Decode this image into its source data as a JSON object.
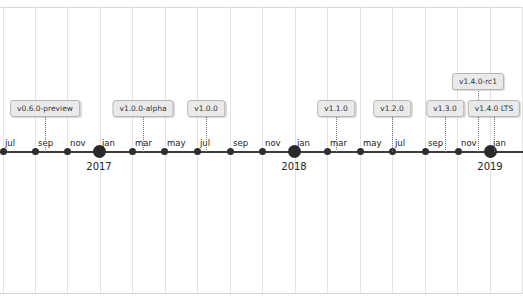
{
  "chart_data": {
    "type": "timeline",
    "title": "",
    "axis": {
      "month_ticks": [
        {
          "label": "jul",
          "x": 3
        },
        {
          "label": "sep",
          "x": 35
        },
        {
          "label": "nov",
          "x": 67
        },
        {
          "label": "jan",
          "x": 99,
          "year": "2017"
        },
        {
          "label": "mar",
          "x": 132
        },
        {
          "label": "may",
          "x": 164
        },
        {
          "label": "jul",
          "x": 197
        },
        {
          "label": "sep",
          "x": 230
        },
        {
          "label": "nov",
          "x": 262
        },
        {
          "label": "jan",
          "x": 294,
          "year": "2018"
        },
        {
          "label": "mar",
          "x": 327
        },
        {
          "label": "may",
          "x": 360
        },
        {
          "label": "jul",
          "x": 392
        },
        {
          "label": "sep",
          "x": 425
        },
        {
          "label": "nov",
          "x": 458
        },
        {
          "label": "jan",
          "x": 490,
          "year": "2019"
        }
      ],
      "years": [
        "2017",
        "2018",
        "2019"
      ],
      "gridlines": [
        3,
        35,
        67,
        100,
        132,
        165,
        197,
        230,
        262,
        295,
        327,
        360,
        392,
        425,
        457,
        490,
        522
      ]
    },
    "events": [
      {
        "label": "v0.6.0-preview",
        "x": 45,
        "box_top": 100,
        "approx_date": "2016-09"
      },
      {
        "label": "v1.0.0-alpha",
        "x": 143,
        "box_top": 100,
        "approx_date": "2017-03"
      },
      {
        "label": "v1.0.0",
        "x": 206,
        "box_top": 100,
        "approx_date": "2017-07"
      },
      {
        "label": "v1.1.0",
        "x": 336,
        "box_top": 100,
        "approx_date": "2018-03"
      },
      {
        "label": "v1.2.0",
        "x": 392,
        "box_top": 100,
        "approx_date": "2018-07"
      },
      {
        "label": "v1.3.0",
        "x": 445,
        "box_top": 100,
        "approx_date": "2018-10"
      },
      {
        "label": "v1.4.0-rc1",
        "x": 478,
        "box_top": 73,
        "approx_date": "2018-12"
      },
      {
        "label": "v1.4.0 LTS",
        "x": 494,
        "box_top": 100,
        "approx_date": "2019-01"
      }
    ],
    "grid": true,
    "legend": null
  }
}
